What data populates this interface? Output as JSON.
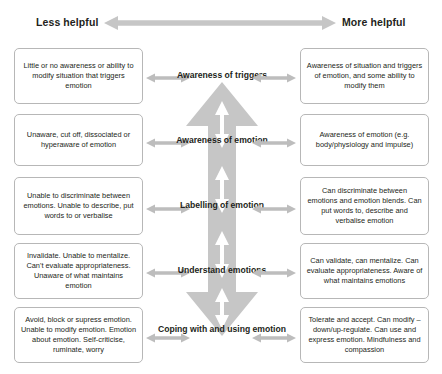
{
  "header": {
    "left_label": "Less helpful",
    "right_label": "More helpful",
    "axis_icon": "double-headed-horizontal-arrow-icon"
  },
  "colors": {
    "arrow_fill": "#c6c6c6",
    "arrow_inner": "#ffffff",
    "box_border": "#b7b7b7",
    "text": "#231f20",
    "background": "#ffffff",
    "connector": "#bdbdbd"
  },
  "center_arrow": {
    "icon": "double-headed-vertical-arrow-icon",
    "description": "Large vertical double-headed arrow running through all stages"
  },
  "rows": [
    {
      "stage": "Awareness of triggers",
      "less_helpful": "Little or no awareness or ability to modify situation that triggers emotion",
      "more_helpful": "Awareness of situation and triggers of emotion, and some ability to modify them"
    },
    {
      "stage": "Awareness of emotion",
      "less_helpful": "Unaware, cut off, dissociated or hyperaware of emotion",
      "more_helpful": "Awareness of emotion (e.g. body/physiology and impulse)"
    },
    {
      "stage": "Labelling of emotion",
      "less_helpful": "Unable to discriminate between emotions. Unable to describe, put words to or verbalise",
      "more_helpful": "Can discriminate between emotions and emotion blends. Can put words to, describe and verbalise emotion"
    },
    {
      "stage": "Understand emotions",
      "less_helpful": "Invalidate. Unable to mentalize. Can't evaluate appropriateness. Unaware of what maintains emotion",
      "more_helpful": "Can validate, can mentalize. Can evaluate appropriateness. Aware of what maintains emotions"
    },
    {
      "stage": "Coping with and using emotion",
      "less_helpful": "Avoid, block or supress emotion. Unable to modify emotion. Emotion about emotion. Self-criticise, ruminate, worry",
      "more_helpful": "Tolerate and accept. Can modify – down/up-regulate. Can use and express emotion. Mindfulness and compassion"
    }
  ]
}
